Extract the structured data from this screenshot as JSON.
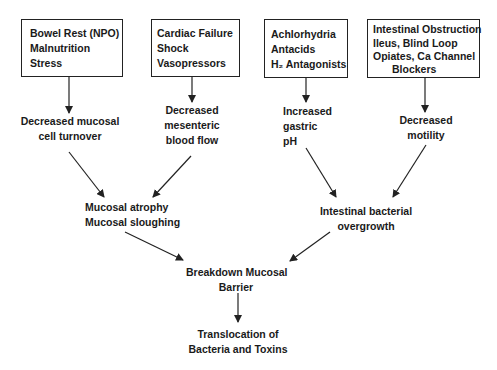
{
  "diagram": {
    "type": "flowchart",
    "causes": [
      {
        "id": "cause1",
        "lines": [
          "Bowel Rest (NPO)",
          "Malnutrition",
          "Stress"
        ]
      },
      {
        "id": "cause2",
        "lines": [
          "Cardiac Failure",
          "Shock",
          "Vasopressors"
        ]
      },
      {
        "id": "cause3",
        "lines": [
          "Achlorhydria",
          "Antacids",
          "H₂ Antagonists"
        ]
      },
      {
        "id": "cause4",
        "lines": [
          "Intestinal Obstruction",
          "Ileus, Blind Loop",
          "Opiates, Ca Channel",
          "Blockers"
        ]
      }
    ],
    "effects": [
      {
        "id": "effect1",
        "lines": [
          "Decreased mucosal",
          "cell turnover"
        ]
      },
      {
        "id": "effect2",
        "lines": [
          "Decreased",
          "mesenteric",
          "blood flow"
        ]
      },
      {
        "id": "effect3",
        "lines": [
          "Increased",
          "gastric",
          "pH"
        ]
      },
      {
        "id": "effect4",
        "lines": [
          "Decreased",
          "motility"
        ]
      }
    ],
    "intermediate": [
      {
        "id": "mid1",
        "lines": [
          "Mucosal atrophy",
          "Mucosal sloughing"
        ]
      },
      {
        "id": "mid2",
        "lines": [
          "Intestinal bacterial",
          "overgrowth"
        ]
      }
    ],
    "breakdown": {
      "lines": [
        "Breakdown Mucosal",
        "Barrier"
      ]
    },
    "outcome": {
      "lines": [
        "Translocation of",
        "Bacteria and Toxins"
      ]
    },
    "edges": [
      [
        "cause1",
        "effect1"
      ],
      [
        "cause2",
        "effect2"
      ],
      [
        "cause3",
        "effect3"
      ],
      [
        "cause4",
        "effect4"
      ],
      [
        "effect1",
        "mid1"
      ],
      [
        "effect2",
        "mid1"
      ],
      [
        "effect3",
        "mid2"
      ],
      [
        "effect4",
        "mid2"
      ],
      [
        "mid1",
        "breakdown"
      ],
      [
        "mid2",
        "breakdown"
      ],
      [
        "breakdown",
        "outcome"
      ]
    ],
    "colors": {
      "line": "#222222",
      "text": "#1a1a1a",
      "background": "#ffffff"
    }
  }
}
